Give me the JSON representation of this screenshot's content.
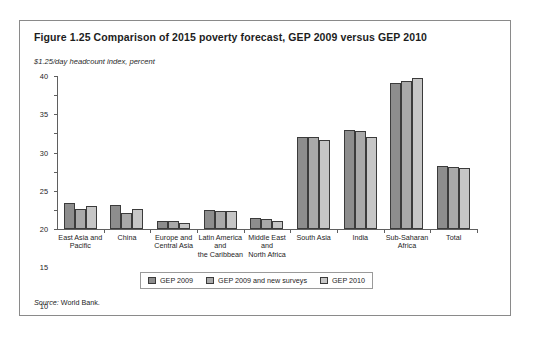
{
  "figure": {
    "title": "Figure 1.25  Comparison of 2015 poverty forecast, GEP 2009 versus GEP 2010",
    "subtitle": "$1.25/day headcount index, percent",
    "source_label": "Source:",
    "source_text": " World Bank."
  },
  "chart_data": {
    "type": "bar",
    "title": "Figure 1.25  Comparison of 2015 poverty forecast, GEP 2009 versus GEP 2010",
    "subtitle": "$1.25/day headcount index, percent",
    "xlabel": "",
    "ylabel": "$1.25/day headcount index, percent",
    "ylim": [
      0,
      40
    ],
    "yticks": [
      0,
      5,
      10,
      15,
      20,
      25,
      30,
      35,
      40
    ],
    "grid": false,
    "legend_position": "bottom",
    "categories": [
      "East Asia and\nPacific",
      "China",
      "Europe and\nCentral Asia",
      "Latin America\nand\nthe Caribbean",
      "Middle East\nand\nNorth Africa",
      "South Asia",
      "India",
      "Sub-Saharan\nAfrica",
      "Total"
    ],
    "series": [
      {
        "name": "GEP 2009",
        "color": "#8d8d8d",
        "values": [
          6.7,
          6.2,
          2.0,
          5.0,
          3.0,
          24.0,
          26.0,
          38.3,
          16.5
        ]
      },
      {
        "name": "GEP 2009 and new surveys",
        "color": "#a9a9a9",
        "values": [
          5.2,
          4.3,
          2.0,
          4.8,
          2.6,
          24.0,
          25.5,
          38.8,
          16.2
        ]
      },
      {
        "name": "GEP 2010",
        "color": "#c6c6c6",
        "values": [
          6.0,
          5.2,
          1.7,
          4.6,
          2.0,
          23.3,
          24.0,
          39.5,
          16.0
        ]
      }
    ]
  }
}
